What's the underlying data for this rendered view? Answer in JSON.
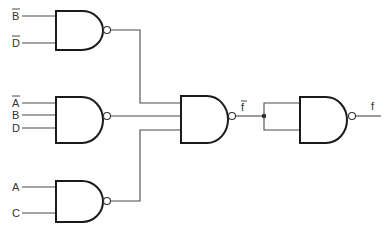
{
  "diagram": {
    "type": "logic-circuit",
    "title": "",
    "gates": [
      {
        "id": "g1",
        "kind": "NAND",
        "inputs": [
          "B̄",
          "D̄"
        ]
      },
      {
        "id": "g2",
        "kind": "NAND",
        "inputs": [
          "Ā",
          "B",
          "D"
        ]
      },
      {
        "id": "g3",
        "kind": "NAND",
        "inputs": [
          "A",
          "C"
        ]
      },
      {
        "id": "g4",
        "kind": "NAND",
        "inputs": [
          "g1",
          "g2",
          "g3"
        ],
        "output_label": "f̄"
      },
      {
        "id": "g5",
        "kind": "NAND",
        "inputs": [
          "f̄",
          "f̄"
        ],
        "output_label": "f"
      }
    ],
    "labels": {
      "g1_in1": "B",
      "g1_in2": "D",
      "g2_in1": "A",
      "g2_in2": "B",
      "g2_in3": "D",
      "g3_in1": "A",
      "g3_in2": "C",
      "fbar": "f",
      "f": "f"
    },
    "overbars": [
      "g1_in1",
      "g1_in2",
      "g2_in1",
      "fbar"
    ]
  },
  "colors": {
    "background": "#ffffff",
    "line": "#1a1a1a"
  }
}
